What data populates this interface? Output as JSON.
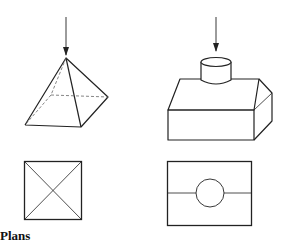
{
  "diagram": {
    "label": "Plans",
    "figures": [
      {
        "name": "pyramid",
        "view": "3d",
        "arrow": "viewing-direction-from-above"
      },
      {
        "name": "hood-with-cylinder",
        "view": "3d",
        "arrow": "viewing-direction-from-above"
      },
      {
        "name": "pyramid-plan",
        "view": "plan",
        "shape": "square with diagonals"
      },
      {
        "name": "hood-plan",
        "view": "plan",
        "shape": "rectangle with midline and circle"
      }
    ],
    "colors": {
      "stroke": "#222222",
      "hidden": "#555555",
      "background": "#ffffff"
    }
  }
}
